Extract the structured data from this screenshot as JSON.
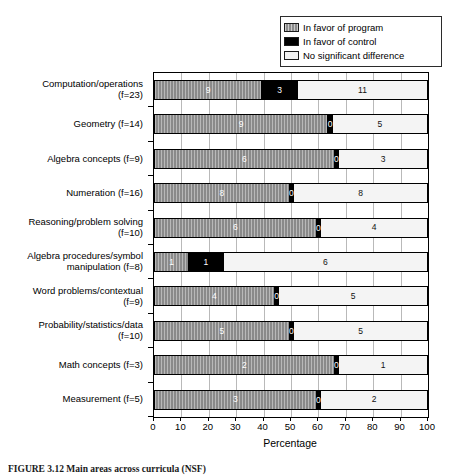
{
  "figure": {
    "caption": "FIGURE 3.12 Main areas across curricula (NSF)",
    "caption_visible_note": "clipped at image bottom edge"
  },
  "legend": {
    "position": "top-right",
    "items": [
      {
        "label": "In favor of program",
        "swatch": "hatched-gray-swatch",
        "color": "#8c8c8c"
      },
      {
        "label": "In favor of control",
        "swatch": "black-swatch",
        "color": "#000000"
      },
      {
        "label": "No significant difference",
        "swatch": "white-swatch",
        "color": "#f2f2f2"
      }
    ]
  },
  "axis": {
    "x_label": "Percentage",
    "x_ticks": [
      0,
      10,
      20,
      30,
      40,
      50,
      60,
      70,
      80,
      90,
      100
    ]
  },
  "chart_data": {
    "type": "bar",
    "orientation": "horizontal",
    "stacked": true,
    "normalized": "100% stacked",
    "title": "",
    "xlabel": "Percentage",
    "ylabel": "",
    "xlim": [
      0,
      100
    ],
    "grid": "vertical gridlines every 10",
    "legend_position": "top-right",
    "value_labels": "raw study counts shown inside segments",
    "categories": [
      "Computation/operations (f=23)",
      "Geometry (f=14)",
      "Algebra concepts (f=9)",
      "Numeration (f=16)",
      "Reasoning/problem solving (f=10)",
      "Algebra procedures/symbol manipulation (f=8)",
      "Word problems/contextual (f=9)",
      "Probability/statistics/data (f=10)",
      "Math concepts (f=3)",
      "Measurement (f=5)"
    ],
    "category_lines": [
      [
        "Computation/operations",
        "(f=23)"
      ],
      [
        "Geometry (f=14)"
      ],
      [
        "Algebra concepts (f=9)"
      ],
      [
        "Numeration (f=16)"
      ],
      [
        "Reasoning/problem solving",
        "(f=10)"
      ],
      [
        "Algebra procedures/symbol",
        "manipulation (f=8)"
      ],
      [
        "Word problems/contextual",
        "(f=9)"
      ],
      [
        "Probability/statistics/data",
        "(f=10)"
      ],
      [
        "Math concepts (f=3)"
      ],
      [
        "Measurement (f=5)"
      ]
    ],
    "series": [
      {
        "name": "In favor of program",
        "values": [
          9,
          9,
          6,
          8,
          6,
          1,
          4,
          5,
          2,
          3
        ]
      },
      {
        "name": "In favor of control",
        "values": [
          3,
          0,
          0,
          0,
          0,
          1,
          0,
          0,
          0,
          0
        ]
      },
      {
        "name": "No significant difference",
        "values": [
          11,
          5,
          3,
          8,
          4,
          6,
          5,
          5,
          1,
          2
        ]
      }
    ],
    "totals": [
      23,
      14,
      9,
      16,
      10,
      8,
      9,
      10,
      3,
      5
    ],
    "percentages": [
      {
        "program": 39.1,
        "control": 13.0,
        "nodiff": 47.8
      },
      {
        "program": 64.3,
        "control": 0.0,
        "nodiff": 35.7
      },
      {
        "program": 66.7,
        "control": 0.0,
        "nodiff": 33.3
      },
      {
        "program": 50.0,
        "control": 0.0,
        "nodiff": 50.0
      },
      {
        "program": 60.0,
        "control": 0.0,
        "nodiff": 40.0
      },
      {
        "program": 12.5,
        "control": 12.5,
        "nodiff": 75.0
      },
      {
        "program": 44.4,
        "control": 0.0,
        "nodiff": 55.6
      },
      {
        "program": 50.0,
        "control": 0.0,
        "nodiff": 50.0
      },
      {
        "program": 66.7,
        "control": 0.0,
        "nodiff": 33.3
      },
      {
        "program": 60.0,
        "control": 0.0,
        "nodiff": 40.0
      }
    ]
  },
  "colors": {
    "program": "#8a8a8a",
    "control": "#000000",
    "nodiff": "#f4f4f4",
    "axis": "#000000",
    "grid": "#b9b9b9"
  }
}
